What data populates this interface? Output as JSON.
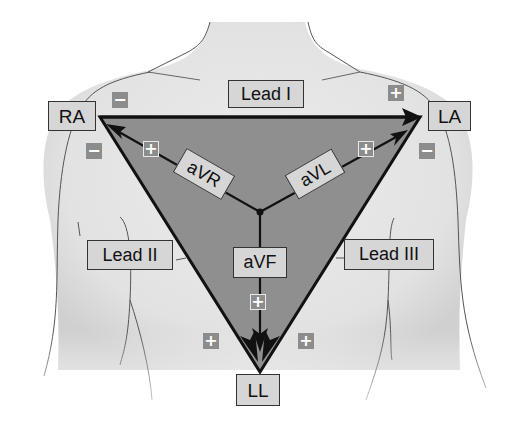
{
  "diagram": {
    "type": "Einthoven's triangle - ECG limb lead placement",
    "colors": {
      "triangle_fill": "#8f8f8f",
      "body_fill": "#e6e6e6",
      "label_fill": "#d6d6d6",
      "sign_fill": "#8c8c8c",
      "line": "#111111"
    },
    "electrodes": {
      "ra": "RA",
      "la": "LA",
      "ll": "LL"
    },
    "bipolar_leads": {
      "lead1": "Lead I",
      "lead2": "Lead II",
      "lead3": "Lead III"
    },
    "augmented_leads": {
      "avr": "aVR",
      "avl": "aVL",
      "avf": "aVF"
    },
    "signs": {
      "minus": "−",
      "plus": "+"
    }
  }
}
